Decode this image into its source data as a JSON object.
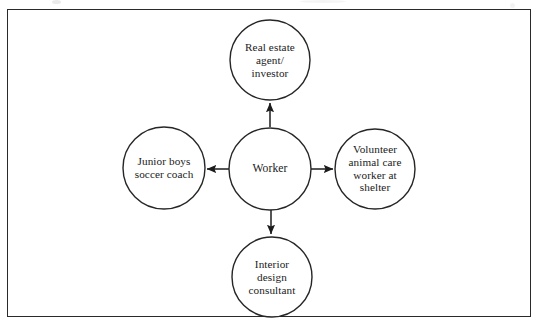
{
  "figure": {
    "type": "hub-and-spoke-diagram",
    "frame": {
      "stroke_color": "#2a2a2a"
    },
    "center": {
      "id": "worker",
      "label": "Worker",
      "cx": 270,
      "cy": 169,
      "r": 41
    },
    "nodes": [
      {
        "id": "real-estate-agent-investor",
        "label": "Real estate\nagent/\ninvestor",
        "position": "top",
        "cx": 270,
        "cy": 60,
        "r": 40,
        "arrow_direction": "from-center-to-node"
      },
      {
        "id": "volunteer-animal-care-worker",
        "label": "Volunteer\nanimal care\nworker at\nshelter",
        "position": "right",
        "cx": 375,
        "cy": 169,
        "r": 40,
        "arrow_direction": "from-center-to-node"
      },
      {
        "id": "interior-design-consultant",
        "label": "Interior\ndesign\nconsultant",
        "position": "bottom",
        "cx": 272,
        "cy": 277,
        "r": 40,
        "arrow_direction": "from-center-to-node"
      },
      {
        "id": "junior-boys-soccer-coach",
        "label": "Junior boys\nsoccer coach",
        "position": "left",
        "cx": 164,
        "cy": 168,
        "r": 41,
        "arrow_direction": "from-center-to-node"
      }
    ],
    "colors": {
      "circle_stroke": "#262626",
      "arrow_stroke": "#1c1c1c",
      "text": "#1a1a1a",
      "background": "#ffffff"
    }
  }
}
